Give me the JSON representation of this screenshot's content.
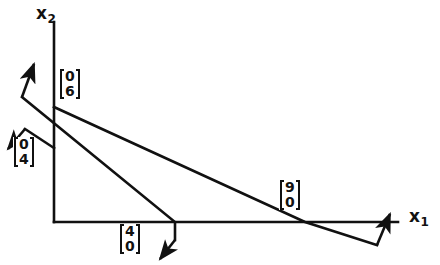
{
  "figure": {
    "background_color": "#ffffff",
    "ink_color": "#111111",
    "width": 440,
    "height": 265
  },
  "axes": {
    "x_axis": {
      "name": "x1",
      "label_main": "x",
      "label_sub": "1",
      "origin": [
        54,
        222
      ],
      "end": [
        398,
        222
      ]
    },
    "y_axis": {
      "name": "x2",
      "label_main": "x",
      "label_sub": "2",
      "origin": [
        54,
        222
      ],
      "end": [
        54,
        22
      ]
    }
  },
  "vector_labels": [
    {
      "id": "vec-0-6",
      "top": "0",
      "bottom": "6",
      "x": 59,
      "y": 69
    },
    {
      "id": "vec-0-4",
      "top": "0",
      "bottom": "4",
      "x": 13,
      "y": 137
    },
    {
      "id": "vec-4-0",
      "top": "4",
      "bottom": "0",
      "x": 119,
      "y": 224
    },
    {
      "id": "vec-9-0",
      "top": "9",
      "bottom": "0",
      "x": 279,
      "y": 180
    }
  ],
  "constraint_lines": [
    {
      "id": "line-shallow",
      "description": "shallow constraint line from y-axis intercept down to x-axis crossing",
      "from": [
        54,
        107
      ],
      "to": [
        305,
        222
      ]
    },
    {
      "id": "line-steep",
      "description": "steep constraint line crossing the y-axis and the x-axis",
      "from": [
        22,
        97
      ],
      "to": [
        175,
        222
      ]
    }
  ],
  "normal_vectors": [
    {
      "id": "normal-up-right",
      "description": "arrow pointing up and to the right from the steep line",
      "from": [
        22,
        97
      ],
      "to": [
        35,
        60
      ]
    },
    {
      "id": "normal-down-left",
      "description": "arrow pointing down and to the left near the 0 4 label",
      "from": [
        25,
        129
      ],
      "to": [
        6,
        152
      ]
    },
    {
      "id": "normal-down-right",
      "description": "arrow pointing down and to the left below the 4 0 label",
      "from": [
        175,
        240
      ],
      "to": [
        158,
        262
      ]
    },
    {
      "id": "normal-right-up",
      "description": "arrow pointing up and to the right near the 9 0 label",
      "from": [
        377,
        245
      ],
      "to": [
        392,
        210
      ]
    }
  ],
  "segments": [
    {
      "id": "seg-steep-lower-to-vertex",
      "from": [
        175,
        222
      ],
      "to": [
        175,
        240
      ]
    },
    {
      "id": "seg-shallow-to-vertex",
      "from": [
        305,
        222
      ],
      "to": [
        377,
        245
      ]
    },
    {
      "id": "seg-normal2-stem",
      "from": [
        25,
        129
      ],
      "to": [
        54,
        148
      ]
    }
  ]
}
